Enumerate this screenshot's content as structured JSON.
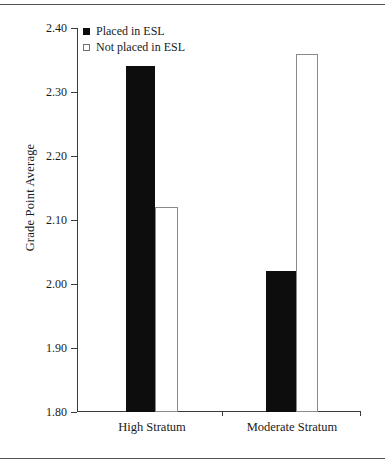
{
  "chart_data": {
    "type": "bar",
    "title": "",
    "xlabel": "",
    "ylabel": "Grade Point Average",
    "categories": [
      "High Stratum",
      "Moderate Stratum"
    ],
    "series": [
      {
        "name": "Placed in ESL",
        "values": [
          2.34,
          2.02
        ],
        "style": "filled",
        "color": "#0d0d0d"
      },
      {
        "name": "Not placed in ESL",
        "values": [
          2.12,
          2.36
        ],
        "style": "open",
        "color": "#ffffff"
      }
    ],
    "ylim": [
      1.8,
      2.4
    ],
    "ytick_step": 0.1,
    "ytick_labels": [
      "2.40",
      "2.30",
      "2.20",
      "2.10",
      "2.00",
      "1.90",
      "1.80"
    ],
    "ytick_values": [
      2.4,
      2.3,
      2.2,
      2.1,
      2.0,
      1.9,
      1.8
    ],
    "grid": false,
    "legend_position": "top-left"
  },
  "legend": {
    "items": [
      {
        "label": "Placed in ESL",
        "marker": "filled-square-icon"
      },
      {
        "label": "Not placed in ESL",
        "marker": "open-square-icon"
      }
    ]
  }
}
